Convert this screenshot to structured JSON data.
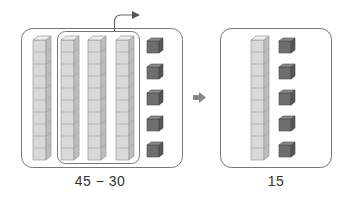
{
  "figure": {
    "left_panel": {
      "label": "45 − 30",
      "tens_rods": 4,
      "ones_cubes": 5,
      "grouped_rods": 3,
      "cubes_per_rod": 10
    },
    "transition_arrow": "➡",
    "right_panel": {
      "label": "15",
      "tens_rods": 1,
      "ones_cubes": 5,
      "cubes_per_rod": 10
    },
    "colors": {
      "rod_front": "#d9d9d9",
      "rod_top": "#efefef",
      "rod_side": "#bdbdbd",
      "rod_line": "#9a9a9a",
      "cube_front": "#6e6e6e",
      "cube_top": "#8a8a8a",
      "cube_side": "#555555",
      "frame": "#777777",
      "arrow": "#666666"
    }
  }
}
